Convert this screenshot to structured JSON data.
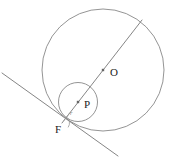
{
  "figure": {
    "background_color": "#ffffff",
    "stroke_color": "#888888",
    "label_color": "#222222",
    "width": 172,
    "height": 163,
    "points": [
      {
        "id": "O",
        "label": "O",
        "role": "center-large-circle",
        "x": 103,
        "y": 70,
        "label_x": 110,
        "label_y": 76
      },
      {
        "id": "P",
        "label": "P",
        "role": "center-small-circle",
        "x": 78,
        "y": 102,
        "label_x": 84,
        "label_y": 108
      },
      {
        "id": "F",
        "label": "F",
        "role": "tangency-point",
        "x": 62,
        "y": 123,
        "label_x": 55,
        "label_y": 133
      }
    ],
    "circles": [
      {
        "id": "large-circle",
        "name": "circle-O",
        "center_x": 103,
        "center_y": 70,
        "radius": 61
      },
      {
        "id": "small-circle",
        "name": "circle-P",
        "center_x": 78,
        "center_y": 102,
        "radius": 19.5
      }
    ],
    "lines": [
      {
        "id": "diameter-line",
        "name": "line-F-P-O-extended",
        "x1": 62,
        "y1": 123,
        "x2": 142,
        "y2": 20
      },
      {
        "id": "tangent-line",
        "name": "common-tangent-at-F",
        "x1": 2,
        "y1": 73,
        "x2": 118,
        "y2": 156
      }
    ],
    "annotations": [
      {
        "id": "radius-label",
        "label": "r",
        "role": "radius-of-small-circle",
        "x": 70,
        "y": 115
      },
      {
        "id": "right-angle-mark",
        "role": "angle-marker-at-F",
        "x": 62,
        "y": 123
      }
    ]
  }
}
